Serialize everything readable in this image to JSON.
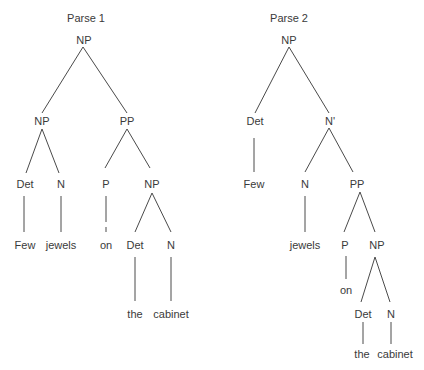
{
  "parse1": {
    "title": "Parse 1",
    "nodes": {
      "root": "NP",
      "np_left": "NP",
      "pp": "PP",
      "det": "Det",
      "n": "N",
      "p": "P",
      "np_right": "NP",
      "np_det": "Det",
      "np_n": "N"
    },
    "words": {
      "few": "Few",
      "jewels": "jewels",
      "on": "on",
      "the": "the",
      "cabinet": "cabinet"
    }
  },
  "parse2": {
    "title": "Parse 2",
    "nodes": {
      "root": "NP",
      "det": "Det",
      "nbar": "N'",
      "n": "N",
      "pp": "PP",
      "p": "P",
      "np": "NP",
      "np_det": "Det",
      "np_n": "N"
    },
    "words": {
      "few": "Few",
      "jewels": "jewels",
      "on": "on",
      "the": "the",
      "cabinet": "cabinet"
    }
  },
  "colors": {
    "line": "#4a4a4a",
    "text": "#3a3a3a"
  }
}
